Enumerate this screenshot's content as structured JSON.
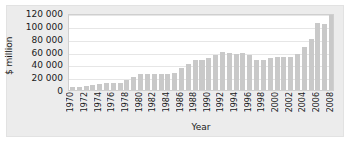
{
  "chart_data": {
    "type": "bar",
    "title": "",
    "subtitle": "",
    "xlabel": "Year",
    "ylabel": "$ million",
    "ylim": [
      0,
      120000
    ],
    "ytick_labels": [
      "0",
      "20 000",
      "40 000",
      "60 000",
      "80 000",
      "100 000",
      "120 000"
    ],
    "ytick_values": [
      0,
      20000,
      40000,
      60000,
      80000,
      100000,
      120000
    ],
    "grid": true,
    "legend": null,
    "legend_position": "none",
    "bar_color": "#c9c9c9",
    "plot_background": "#ffffff",
    "figure_background": "#ececec",
    "gridline_color": "#e6e6e6",
    "xtick_labels_shown": [
      "1970",
      "1972",
      "1974",
      "1976",
      "1978",
      "1980",
      "1982",
      "1984",
      "1986",
      "1988",
      "1990",
      "1992",
      "1994",
      "1996",
      "1998",
      "2000",
      "2002",
      "2004",
      "2006",
      "2008"
    ],
    "categories": [
      "1970",
      "1971",
      "1972",
      "1973",
      "1974",
      "1975",
      "1976",
      "1977",
      "1978",
      "1979",
      "1980",
      "1981",
      "1982",
      "1983",
      "1984",
      "1985",
      "1986",
      "1987",
      "1988",
      "1989",
      "1990",
      "1991",
      "1992",
      "1993",
      "1994",
      "1995",
      "1996",
      "1997",
      "1998",
      "1999",
      "2000",
      "2001",
      "2002",
      "2003",
      "2004",
      "2005",
      "2006",
      "2007",
      "2008"
    ],
    "values": [
      4500,
      5000,
      6000,
      8000,
      9500,
      10500,
      11000,
      11500,
      15500,
      20000,
      25000,
      24500,
      25500,
      25500,
      25500,
      26500,
      34000,
      41000,
      46000,
      47000,
      50000,
      55000,
      59500,
      57000,
      56500,
      57000,
      55000,
      47000,
      47500,
      50500,
      51000,
      51500,
      51000,
      55500,
      67000,
      79000,
      105000,
      103000,
      116500
    ]
  }
}
